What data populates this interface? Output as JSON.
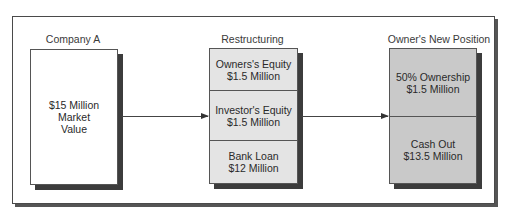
{
  "diagram": {
    "columns": [
      {
        "title": "Company A",
        "boxes": [
          {
            "lines": [
              "$15 Million",
              "Market",
              "Value"
            ]
          }
        ]
      },
      {
        "title": "Restructuring",
        "boxes": [
          {
            "lines": [
              "Owners's Equity",
              "$1.5 Million"
            ]
          },
          {
            "lines": [
              "Investor's Equity",
              "$1.5 Million"
            ]
          },
          {
            "lines": [
              "Bank Loan",
              "$12 Million"
            ]
          }
        ]
      },
      {
        "title": "Owner's New Position",
        "boxes": [
          {
            "lines": [
              "50% Ownership",
              "$1.5 Million"
            ]
          },
          {
            "lines": [
              "Cash Out",
              "$13.5 Million"
            ]
          }
        ]
      }
    ],
    "arrows": [
      {
        "from": "Company A",
        "to": "Restructuring"
      },
      {
        "from": "Restructuring",
        "to": "Owner's New Position"
      }
    ],
    "colors": {
      "company_box": "#ffffff",
      "restructuring_box": "#e4e4e4",
      "new_position_box": "#c9c9c9",
      "shadow": "#3c3c3c",
      "border": "#555555"
    }
  }
}
